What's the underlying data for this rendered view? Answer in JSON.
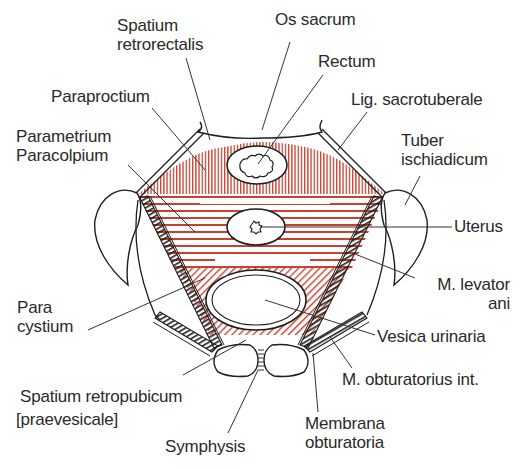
{
  "diagram": {
    "colors": {
      "hatch_red": "#c8412f",
      "outline": "#1e1e1e",
      "background": "#ffffff",
      "text": "#2a2a2a"
    },
    "labels": {
      "spatium_retrorectalis": "Spatium\nretrorectalis",
      "os_sacrum": "Os sacrum",
      "rectum": "Rectum",
      "paraproctium": "Paraproctium",
      "lig_sacrotuberale": "Lig. sacrotuberale",
      "parametrium": "Parametrium\nParacolpium",
      "tuber_ischiadicum": "Tuber\nischiadicum",
      "uterus": "Uterus",
      "m_levator_ani": "M. levator\nani",
      "paracystium": "Para\ncystium",
      "vesica_urinaria": "Vesica urinaria",
      "m_obturatorius_int": "M. obturatorius int.",
      "spatium_retropubicum": "Spatium retropubicum",
      "praevesicale": "[praevesicale]",
      "symphysis": "Symphysis",
      "membrana_obturatoria": "Membrana\nobturatoria"
    }
  }
}
